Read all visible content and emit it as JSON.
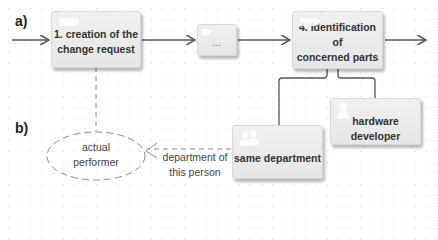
{
  "labels": {
    "a": "a)",
    "b": "b)"
  },
  "process": {
    "step1": {
      "label": "1. creation of the change request",
      "line1": "1. creation of the",
      "line2": "change request",
      "icon": "process-icon"
    },
    "ellipsis": {
      "label": "..."
    },
    "step4": {
      "label": "4. identification of concerned parts",
      "line1": "4. identification of",
      "line2": "concerned parts",
      "icon": "process-icon"
    }
  },
  "roles": {
    "hardware_developer": {
      "label": "hardware developer",
      "icon": "person-icon"
    },
    "same_department": {
      "label": "same department",
      "icon": "group-icon"
    }
  },
  "performer": {
    "line1": "actual",
    "line2": "performer"
  },
  "edge_label": {
    "line1": "department of",
    "line2": "this person"
  },
  "colors": {
    "box_fill": "#ececec",
    "line": "#555555",
    "dashed": "#8a8a8a",
    "grid_dot": "#d4d4d4"
  }
}
